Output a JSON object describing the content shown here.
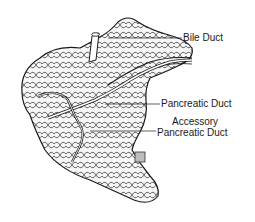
{
  "figure": {
    "labels": {
      "bile_duct": "Bile Duct",
      "pancreatic_duct": "Pancreatic Duct",
      "accessory_line1": "Accessory",
      "accessory_line2": "Pancreatic Duct"
    },
    "colors": {
      "ink": "#1a1a1a",
      "background": "#ffffff",
      "tissue_fill": "#f4f4f4"
    }
  }
}
